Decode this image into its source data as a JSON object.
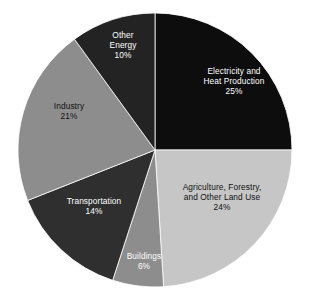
{
  "chart_data": {
    "type": "pie",
    "title": "",
    "subtitle": "",
    "xlabel": "",
    "ylabel": "",
    "legend_position": "none",
    "labels_inside_slices": true,
    "start_angle_deg": 270,
    "direction": "clockwise",
    "categories": [
      "Electricity and Heat Production",
      "Agriculture, Forestry, and Other Land Use",
      "Buildings",
      "Transportation",
      "Industry",
      "Other Energy"
    ],
    "values": [
      25,
      24,
      6,
      14,
      21,
      10
    ],
    "unit": "%",
    "slices": [
      {
        "name": "Electricity and Heat Production",
        "label_line1": "Electricity and",
        "label_line2": "Heat Production",
        "value": 25,
        "value_label": "25%",
        "color": "#0d0d0d",
        "text_color": "#ffffff",
        "start_deg": 270,
        "end_deg": 360
      },
      {
        "name": "Agriculture, Forestry, and Other Land Use",
        "label_line1": "Agriculture, Forestry,",
        "label_line2": "and Other Land Use",
        "value": 24,
        "value_label": "24%",
        "color": "#c6c6c6",
        "text_color": "#111111",
        "start_deg": 0,
        "end_deg": 86.4
      },
      {
        "name": "Buildings",
        "label_line1": "Buildings",
        "label_line2": "",
        "value": 6,
        "value_label": "6%",
        "color": "#8d8d8d",
        "text_color": "#ffffff",
        "start_deg": 86.4,
        "end_deg": 108
      },
      {
        "name": "Transportation",
        "label_line1": "Transportation",
        "label_line2": "",
        "value": 14,
        "value_label": "14%",
        "color": "#2f2f2f",
        "text_color": "#ffffff",
        "start_deg": 108,
        "end_deg": 158.4
      },
      {
        "name": "Industry",
        "label_line1": "Industry",
        "label_line2": "",
        "value": 21,
        "value_label": "21%",
        "color": "#8d8d8d",
        "text_color": "#111111",
        "start_deg": 158.4,
        "end_deg": 234
      },
      {
        "name": "Other Energy",
        "label_line1": "Other",
        "label_line2": "Energy",
        "value": 10,
        "value_label": "10%",
        "color": "#232323",
        "text_color": "#ffffff",
        "start_deg": 234,
        "end_deg": 270
      }
    ],
    "geometry": {
      "center_x": 155,
      "center_y": 150,
      "radius": 137
    },
    "background_color": "#ffffff"
  }
}
